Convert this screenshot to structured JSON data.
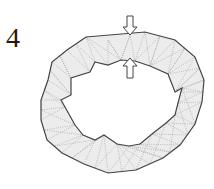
{
  "figure": {
    "panel_label": "4",
    "caption": "",
    "colors": {
      "mesh_fill": "#ececec",
      "boundary": "#444444",
      "mesh_lines": "#9a9a9a",
      "arrow_stroke": "#444444",
      "arrow_fill": "#ffffff"
    },
    "arrows": [
      {
        "name": "outer-load-arrow",
        "direction": "down",
        "x": 130,
        "y_tip": 35
      },
      {
        "name": "inner-load-arrow",
        "direction": "up",
        "x": 130,
        "y_tip": 58
      }
    ]
  }
}
